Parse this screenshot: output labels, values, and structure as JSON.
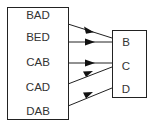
{
  "diagram": {
    "type": "mapping",
    "domain": [
      "BAD",
      "BED",
      "CAB",
      "CAD",
      "DAB"
    ],
    "codomain": [
      "B",
      "C",
      "D"
    ],
    "mappings": [
      {
        "from": "BAD",
        "to": "B"
      },
      {
        "from": "BED",
        "to": "B"
      },
      {
        "from": "CAB",
        "to": "C"
      },
      {
        "from": "CAD",
        "to": "C"
      },
      {
        "from": "DAB",
        "to": "D"
      }
    ]
  },
  "left": [
    "BAD",
    "BED",
    "CAB",
    "CAD",
    "DAB"
  ],
  "right": [
    "B",
    "C",
    "D"
  ]
}
